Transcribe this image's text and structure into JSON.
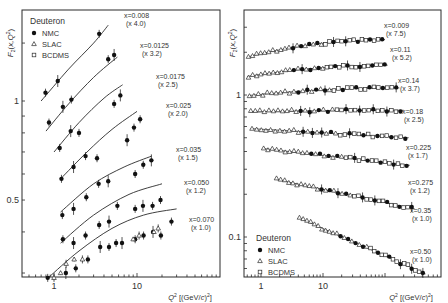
{
  "chart_data": [
    {
      "type": "scatter",
      "title": "",
      "xlabel": "Q² [(GeV/c)²]",
      "ylabel": "F₂(x,Q²)",
      "xscale": "log",
      "yscale": "log",
      "xlim": [
        0.4,
        100
      ],
      "ylim": [
        0.29,
        1.9
      ],
      "xticks": [
        {
          "value": 1,
          "label": "1"
        },
        {
          "value": 10,
          "label": "10"
        }
      ],
      "yticks": [
        {
          "value": 1,
          "label": "1"
        },
        {
          "value": 0.5,
          "label": "0.5"
        }
      ],
      "legend": {
        "title": "Deuteron",
        "position": "upper left",
        "entries": [
          {
            "label": "NMC",
            "marker": "filled-circle"
          },
          {
            "label": "SLAC",
            "marker": "open-triangle"
          },
          {
            "label": "BCDMS",
            "marker": "open-square"
          }
        ]
      },
      "series": [
        {
          "name": "x=0.008",
          "scale": "(x 4.0)",
          "label_pos": [
            124,
            18
          ],
          "fit": [
            [
              0.7,
              1.0
            ],
            [
              1.5,
              1.25
            ],
            [
              3.0,
              1.5
            ],
            [
              4.5,
              1.7
            ]
          ],
          "NMC": [
            [
              0.79,
              1.06
            ],
            [
              1.11,
              1.15
            ],
            [
              3.5,
              1.6
            ]
          ],
          "SLAC": []
        },
        {
          "name": "x=0.0125",
          "scale": "(x 3.2)",
          "label_pos": [
            140,
            48
          ],
          "fit": [
            [
              0.8,
              0.81
            ],
            [
              1.5,
              0.98
            ],
            [
              3.0,
              1.18
            ],
            [
              5.8,
              1.36
            ]
          ],
          "NMC": [
            [
              0.87,
              0.86
            ],
            [
              1.28,
              0.96
            ],
            [
              1.62,
              1.01
            ],
            [
              4.5,
              1.34
            ],
            [
              5.3,
              1.38
            ]
          ],
          "SLAC": []
        },
        {
          "name": "x=0.0175",
          "scale": "(x 2.5)",
          "label_pos": [
            156,
            79
          ],
          "fit": [
            [
              1.0,
              0.7
            ],
            [
              2.0,
              0.86
            ],
            [
              4.0,
              1.02
            ],
            [
              6.7,
              1.12
            ]
          ],
          "NMC": [
            [
              1.17,
              0.72
            ],
            [
              1.59,
              0.81
            ],
            [
              2.0,
              0.8
            ],
            [
              5.3,
              0.98
            ],
            [
              6.3,
              1.04
            ]
          ],
          "SLAC": []
        },
        {
          "name": "x=0.025",
          "scale": "(x 2.0)",
          "label_pos": [
            166,
            108
          ],
          "fit": [
            [
              1.2,
              0.58
            ],
            [
              2.5,
              0.7
            ],
            [
              5.0,
              0.82
            ],
            [
              10.0,
              0.93
            ]
          ],
          "NMC": [
            [
              1.23,
              0.58
            ],
            [
              1.72,
              0.63
            ],
            [
              2.4,
              0.68
            ],
            [
              3.3,
              0.67
            ],
            [
              7.6,
              0.76
            ],
            [
              9.2,
              0.83
            ],
            [
              10.9,
              0.88
            ]
          ],
          "SLAC": []
        },
        {
          "name": "x=0.035",
          "scale": "(x 1.5)",
          "label_pos": [
            176,
            152
          ],
          "fit": [
            [
              1.2,
              0.46
            ],
            [
              3.0,
              0.56
            ],
            [
              7.0,
              0.63
            ],
            [
              15.0,
              0.68
            ]
          ],
          "NMC": [
            [
              1.26,
              0.45
            ],
            [
              1.72,
              0.47
            ],
            [
              2.45,
              0.51
            ],
            [
              3.45,
              0.56
            ],
            [
              4.5,
              0.57
            ],
            [
              9.5,
              0.6
            ],
            [
              11.9,
              0.64
            ],
            [
              14.9,
              0.66
            ]
          ],
          "SLAC": []
        },
        {
          "name": "x=0.050",
          "scale": "(x 1.2)",
          "label_pos": [
            184,
            185
          ],
          "fit": [
            [
              1.2,
              0.37
            ],
            [
              3.0,
              0.45
            ],
            [
              8.0,
              0.52
            ],
            [
              20.0,
              0.56
            ]
          ],
          "NMC": [
            [
              1.28,
              0.38
            ],
            [
              1.72,
              0.37
            ],
            [
              2.4,
              0.39
            ],
            [
              3.5,
              0.42
            ],
            [
              4.6,
              0.43
            ],
            [
              5.8,
              0.48
            ],
            [
              9.5,
              0.47
            ],
            [
              11.8,
              0.48
            ],
            [
              15.4,
              0.48
            ],
            [
              19.2,
              0.5
            ]
          ],
          "SLAC": []
        },
        {
          "name": "x=0.070",
          "scale": "(x 1.0)",
          "label_pos": [
            189,
            222
          ],
          "fit": [
            [
              0.85,
              0.29
            ],
            [
              2.0,
              0.35
            ],
            [
              5.0,
              0.41
            ],
            [
              12.0,
              0.45
            ],
            [
              30.0,
              0.47
            ]
          ],
          "NMC": [
            [
              0.84,
              0.29
            ],
            [
              1.39,
              0.3
            ],
            [
              1.83,
              0.31
            ],
            [
              2.56,
              0.33
            ],
            [
              3.6,
              0.36
            ],
            [
              4.6,
              0.36
            ],
            [
              5.6,
              0.37
            ],
            [
              6.6,
              0.37
            ],
            [
              9.5,
              0.38
            ],
            [
              12.0,
              0.39
            ],
            [
              15.6,
              0.4
            ],
            [
              19.4,
              0.39
            ],
            [
              26.0,
              0.43
            ]
          ],
          "SLAC": [
            [
              1.0,
              0.29
            ],
            [
              1.2,
              0.3
            ],
            [
              1.4,
              0.32
            ],
            [
              1.75,
              0.33
            ],
            [
              2.2,
              0.33
            ],
            [
              9.0,
              0.38
            ],
            [
              10.6,
              0.39
            ],
            [
              16.0,
              0.4
            ],
            [
              18.0,
              0.41
            ]
          ]
        }
      ]
    },
    {
      "type": "scatter",
      "title": "",
      "xlabel": "Q² [(GeV/c)²]",
      "ylabel": "F₂(x,Q²)",
      "xscale": "log",
      "yscale": "log",
      "xlim": [
        0.55,
        800
      ],
      "ylim": [
        0.052,
        4.0
      ],
      "xticks": [
        {
          "value": 1,
          "label": "1"
        },
        {
          "value": 10,
          "label": "10"
        }
      ],
      "yticks": [
        {
          "value": 1,
          "label": "1"
        },
        {
          "value": 0.1,
          "label": "0.1"
        }
      ],
      "legend": {
        "title": "Deuteron",
        "position": "lower left",
        "entries": [
          {
            "label": "NMC",
            "marker": "filled-circle"
          },
          {
            "label": "SLAC",
            "marker": "open-triangle"
          },
          {
            "label": "BCDMS",
            "marker": "open-square"
          }
        ]
      },
      "series": [
        {
          "name": "x=0.009",
          "scale": "(x 7.5)",
          "label_pos": [
            384,
            28
          ],
          "qmin": 0.6,
          "qmax": 100,
          "f_lo": 1.85,
          "f_hi": 2.45
        },
        {
          "name": "x=0.11",
          "scale": "(x 5.2)",
          "label_pos": [
            390,
            52
          ],
          "qmin": 0.6,
          "qmax": 110,
          "f_lo": 1.35,
          "f_hi": 1.62
        },
        {
          "name": "x=0.14",
          "scale": "(x 3.7)",
          "label_pos": [
            398,
            83
          ],
          "qmin": 0.62,
          "qmax": 170,
          "f_lo": 0.99,
          "f_hi": 1.12
        },
        {
          "name": "x=0.18",
          "scale": "(x 2.5)",
          "label_pos": [
            402,
            114
          ],
          "qmin": 0.65,
          "qmax": 200,
          "f_lo": 0.76,
          "f_hi": 0.78
        },
        {
          "name": "x=0.225",
          "scale": "(x 1.7)",
          "label_pos": [
            406,
            150
          ],
          "qmin": 0.68,
          "qmax": 240,
          "f_lo": 0.58,
          "f_hi": 0.5
        },
        {
          "name": "x=0.275",
          "scale": "(x 1.2)",
          "label_pos": [
            408,
            185
          ],
          "qmin": 1.05,
          "qmax": 250,
          "f_lo": 0.42,
          "f_hi": 0.32
        },
        {
          "name": "x=0.35",
          "scale": "(x 1.0)",
          "label_pos": [
            410,
            213
          ],
          "qmin": 1.7,
          "qmax": 300,
          "f_lo": 0.255,
          "f_hi": 0.158
        },
        {
          "name": "x=0.50",
          "scale": "(x 1.0)",
          "label_pos": [
            410,
            254
          ],
          "qmin": 4.0,
          "qmax": 450,
          "f_lo": 0.137,
          "f_hi": 0.055
        }
      ]
    }
  ],
  "panels": {
    "left": {
      "frame": [
        22,
        10,
        220,
        277
      ],
      "x0px": 54,
      "xdec": 83,
      "y1px": 101,
      "ydec": 329
    },
    "right": {
      "frame": [
        244,
        10,
        441,
        277
      ],
      "x0px": 261,
      "xdec": 62,
      "y1px": 95,
      "ydec": 142
    }
  }
}
